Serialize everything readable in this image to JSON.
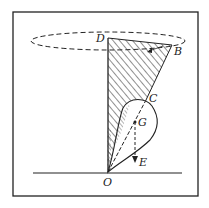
{
  "figure": {
    "labels": {
      "D": "D",
      "B": "B",
      "C": "C",
      "G": "G",
      "E": "E",
      "O": "O"
    }
  }
}
